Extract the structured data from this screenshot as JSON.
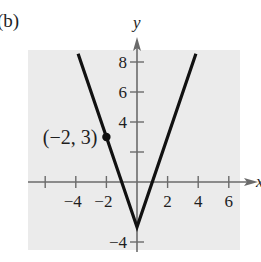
{
  "panel_label": "(b)",
  "chart_data": {
    "type": "line",
    "title": "",
    "xlabel": "x",
    "ylabel": "y",
    "xlim": [
      -6.2,
      6.6
    ],
    "ylim": [
      -4.6,
      9.4
    ],
    "grid": false,
    "legend": null,
    "x_ticks": [
      -6,
      -4,
      -2,
      2,
      4,
      6
    ],
    "x_tick_labels": [
      "",
      "−4",
      "−2",
      "2",
      "4",
      "6"
    ],
    "y_ticks": [
      8,
      6,
      4,
      2,
      -4
    ],
    "y_tick_labels": [
      "8",
      "6",
      "4",
      "",
      "−4"
    ],
    "series": [
      {
        "name": "y = 3|x| − 3",
        "x": [
          -3.85,
          0,
          3.85
        ],
        "y": [
          8.55,
          -3,
          8.55
        ]
      }
    ],
    "points": [
      {
        "x": -2,
        "y": 3,
        "label": "(−2, 3)"
      }
    ],
    "annotations": [
      "(−2, 3)"
    ]
  },
  "style": {
    "background": "#ebebeb",
    "line_color": "#111111",
    "axis_color": "#6b6b6b"
  }
}
